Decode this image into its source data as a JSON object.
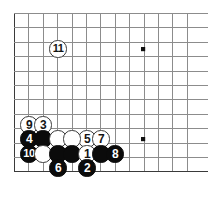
{
  "diagram": {
    "type": "go-board-joseki-diagram",
    "board": {
      "background_color": "#ffffff",
      "line_color": "#8c8c8c",
      "edge_color": "#3a3a3a",
      "star_point_color": "#101010",
      "grid_spacing_px": 14.4,
      "origin_x_px": 14,
      "origin_y_px": 13,
      "columns": 13,
      "rows": 12,
      "star_points": [
        {
          "name": "star-point-upper",
          "x": 143,
          "y": 49
        },
        {
          "name": "star-point-lower",
          "x": 143,
          "y": 139
        }
      ]
    },
    "stones": [
      {
        "move": "11",
        "label": "11",
        "color": "white",
        "x": 58,
        "y": 49,
        "name": "stone-white-11"
      },
      {
        "move": "9",
        "label": "9",
        "color": "white",
        "x": 29,
        "y": 125,
        "name": "stone-white-9"
      },
      {
        "move": "3",
        "label": "3",
        "color": "white",
        "x": 43,
        "y": 125,
        "name": "stone-white-3"
      },
      {
        "move": "5",
        "label": "5",
        "color": "white",
        "x": 87,
        "y": 139,
        "name": "stone-white-5"
      },
      {
        "move": "7",
        "label": "7",
        "color": "white",
        "x": 101,
        "y": 139,
        "name": "stone-white-7"
      },
      {
        "move": "4",
        "label": "4",
        "color": "black",
        "x": 29,
        "y": 139,
        "name": "stone-black-4"
      },
      {
        "move": "-",
        "label": "",
        "color": "black",
        "x": 43,
        "y": 139,
        "name": "stone-black-plain-a"
      },
      {
        "move": "-",
        "label": "",
        "color": "white",
        "x": 58,
        "y": 139,
        "name": "stone-white-plain-a"
      },
      {
        "move": "-",
        "label": "",
        "color": "white",
        "x": 72,
        "y": 139,
        "name": "stone-white-plain-b"
      },
      {
        "move": "10",
        "label": "10",
        "color": "black",
        "x": 29,
        "y": 154,
        "name": "stone-black-10"
      },
      {
        "move": "-",
        "label": "",
        "color": "white",
        "x": 43,
        "y": 154,
        "name": "stone-white-plain-c"
      },
      {
        "move": "-",
        "label": "",
        "color": "black",
        "x": 58,
        "y": 154,
        "name": "stone-black-plain-b"
      },
      {
        "move": "-",
        "label": "",
        "color": "black",
        "x": 72,
        "y": 154,
        "name": "stone-black-plain-c"
      },
      {
        "move": "1",
        "label": "1",
        "color": "white",
        "x": 87,
        "y": 154,
        "name": "stone-white-1"
      },
      {
        "move": "-",
        "label": "",
        "color": "black",
        "x": 101,
        "y": 154,
        "name": "stone-black-plain-d"
      },
      {
        "move": "8",
        "label": "8",
        "color": "black",
        "x": 115,
        "y": 154,
        "name": "stone-black-8"
      },
      {
        "move": "6",
        "label": "6",
        "color": "black",
        "x": 58,
        "y": 168,
        "name": "stone-black-6"
      },
      {
        "move": "2",
        "label": "2",
        "color": "black",
        "x": 87,
        "y": 168,
        "name": "stone-black-2"
      }
    ]
  }
}
